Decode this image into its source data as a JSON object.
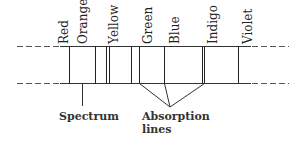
{
  "diagram": {
    "colors": [
      {
        "name": "Red",
        "x": 67
      },
      {
        "name": "Orange",
        "x": 86
      },
      {
        "name": "Yellow",
        "x": 117
      },
      {
        "name": "Green",
        "x": 151
      },
      {
        "name": "Blue",
        "x": 178
      },
      {
        "name": "Indigo",
        "x": 216
      },
      {
        "name": "Violet",
        "x": 251
      }
    ],
    "spectrum_label": "Spectrum",
    "absorption_label_line1": "Absorption",
    "absorption_label_line2": "lines",
    "line_color": "#333333"
  }
}
